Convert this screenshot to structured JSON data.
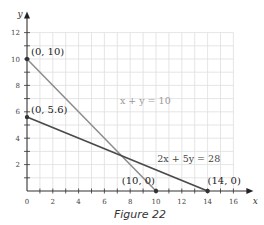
{
  "caption": "Figure 22",
  "chart_data": {
    "type": "line",
    "title": "",
    "xlabel": "x",
    "ylabel": "y",
    "xlim": [
      0,
      16
    ],
    "ylim": [
      0,
      12
    ],
    "grid": true,
    "x_ticks": [
      0,
      2,
      4,
      6,
      8,
      10,
      12,
      14,
      16
    ],
    "y_ticks": [
      2,
      4,
      6,
      8,
      10,
      12
    ],
    "series": [
      {
        "name": "x + y = 10",
        "color": "#8c8c8c",
        "points": [
          [
            0,
            10
          ],
          [
            10,
            0
          ]
        ],
        "label_pos": [
          7.2,
          6.6
        ]
      },
      {
        "name": "2x + 5y = 28",
        "color": "#4a4a4a",
        "points": [
          [
            0,
            5.6
          ],
          [
            14,
            0
          ]
        ],
        "label_pos": [
          10.1,
          2.2
        ]
      }
    ],
    "annotations": [
      {
        "text": "(0, 10)",
        "x": 0,
        "y": 10
      },
      {
        "text": "(0, 5.6)",
        "x": 0,
        "y": 5.6
      },
      {
        "text": "(10, 0)",
        "x": 10,
        "y": 0
      },
      {
        "text": "(14, 0)",
        "x": 14,
        "y": 0
      }
    ],
    "intersection": [
      7.33,
      2.67
    ]
  }
}
